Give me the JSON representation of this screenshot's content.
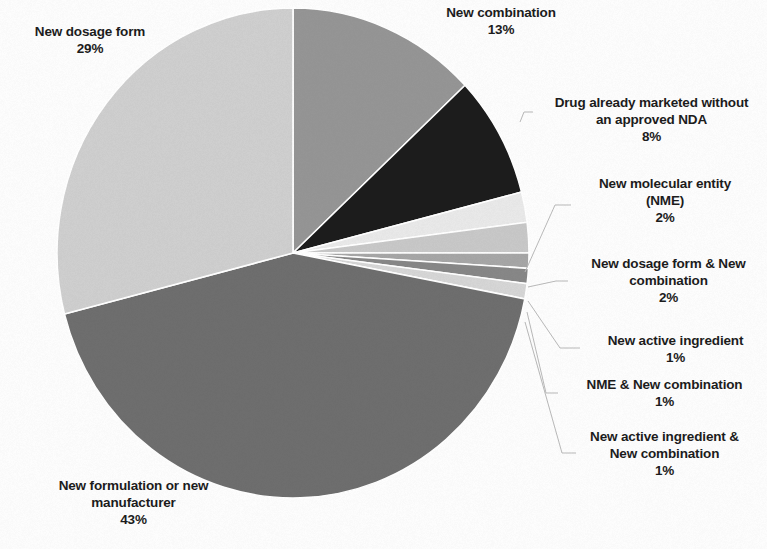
{
  "figure": {
    "type": "pie-chart-scan",
    "background_color": "#fdfdfd",
    "text_color": "#1c1c1c",
    "leader_line_color": "#b9b9b9"
  },
  "chart_data": {
    "type": "pie",
    "title": "",
    "subtitle": "",
    "xlabel": "",
    "ylabel": "",
    "legend_position": "none",
    "labels_outside": true,
    "value_suffix": "%",
    "total": 100,
    "start_angle_deg": 0,
    "direction": "clockwise",
    "center_px": [
      293,
      253
    ],
    "radius_x_px": 236,
    "radius_y_px": 245,
    "categories": [
      "New combination",
      "Drug already marketed without an approved NDA",
      "New molecular entity (NME)",
      "New dosage form & New combination",
      "New active ingredient",
      "NME & New combination",
      "New active ingredient & New combination",
      "New formulation or new manufacturer",
      "New dosage form"
    ],
    "values": [
      13,
      8,
      2,
      2,
      1,
      1,
      1,
      43,
      29
    ],
    "colors": [
      "#959595",
      "#1a1a1a",
      "#e9e9e9",
      "#c8c8c8",
      "#a6a6a6",
      "#878787",
      "#d6d6d6",
      "#6e6e6e",
      "#cfcfcf"
    ],
    "slices": [
      {
        "label": "New combination",
        "percent": 13,
        "percent_text": "13%",
        "color": "#959595",
        "start_deg": 0,
        "end_deg": 46.8,
        "label_position": "top-center"
      },
      {
        "label": "Drug already marketed without an approved NDA",
        "label_line1": "Drug already marketed without",
        "label_line2": "an approved NDA",
        "percent": 8,
        "percent_text": "8%",
        "color": "#1a1a1a",
        "start_deg": 46.8,
        "end_deg": 75.6,
        "label_position": "right",
        "has_leader_line": true
      },
      {
        "label": "New molecular entity (NME)",
        "label_line1": "New molecular entity",
        "label_line2": "(NME)",
        "percent": 2,
        "percent_text": "2%",
        "color": "#e9e9e9",
        "start_deg": 75.6,
        "end_deg": 82.8,
        "label_position": "right",
        "has_leader_line": true
      },
      {
        "label": "New dosage form & New combination",
        "label_line1": "New dosage form & New",
        "label_line2": "combination",
        "percent": 2,
        "percent_text": "2%",
        "color": "#c8c8c8",
        "start_deg": 82.8,
        "end_deg": 90.0,
        "label_position": "right",
        "has_leader_line": true
      },
      {
        "label": "New active ingredient",
        "label_line1": "New active ingredient",
        "percent": 1,
        "percent_text": "1%",
        "color": "#a6a6a6",
        "start_deg": 90.0,
        "end_deg": 93.6,
        "label_position": "right",
        "has_leader_line": true
      },
      {
        "label": "NME & New combination",
        "label_line1": "NME & New combination",
        "percent": 1,
        "percent_text": "1%",
        "color": "#878787",
        "start_deg": 93.6,
        "end_deg": 97.2,
        "label_position": "right",
        "has_leader_line": true
      },
      {
        "label": "New active ingredient & New combination",
        "label_line1": "New active ingredient &",
        "label_line2": "New combination",
        "percent": 1,
        "percent_text": "1%",
        "color": "#d6d6d6",
        "start_deg": 97.2,
        "end_deg": 100.8,
        "label_position": "right",
        "has_leader_line": true
      },
      {
        "label": "New formulation or new manufacturer",
        "label_line1": "New formulation or new",
        "label_line2": "manufacturer",
        "percent": 43,
        "percent_text": "43%",
        "color": "#6e6e6e",
        "start_deg": 100.8,
        "end_deg": 255.6,
        "label_position": "bottom-left"
      },
      {
        "label": "New dosage form",
        "label_line1": "New dosage form",
        "percent": 29,
        "percent_text": "29%",
        "color": "#cfcfcf",
        "start_deg": 255.6,
        "end_deg": 360.0,
        "label_position": "top-left"
      }
    ]
  }
}
